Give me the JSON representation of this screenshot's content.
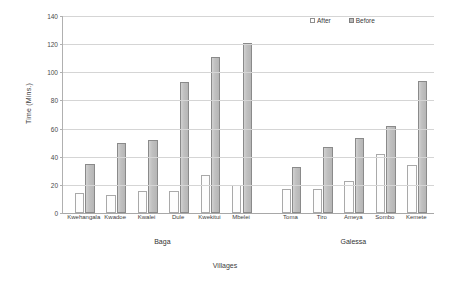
{
  "chart_data": {
    "type": "bar",
    "title": "",
    "xlabel": "Villages",
    "ylabel": "Time (Mins.)",
    "ylim": [
      0,
      140
    ],
    "ytick_step": 20,
    "yticks": [
      0,
      20,
      40,
      60,
      80,
      100,
      120,
      140
    ],
    "grid": true,
    "legend_position": "top-right",
    "categories": [
      "Kwehangala",
      "Kwadoe",
      "Kwalei",
      "Dule",
      "Kwekitui",
      "Mbelei",
      "Toma",
      "Tiro",
      "Ameya",
      "Sombo",
      "Kemete"
    ],
    "groups": [
      {
        "label": "Baga",
        "categories": [
          "Kwehangala",
          "Kwadoe",
          "Kwalei",
          "Dule",
          "Kwekitui",
          "Mbelei"
        ]
      },
      {
        "label": "Galessa",
        "categories": [
          "Toma",
          "Tiro",
          "Ameya",
          "Sombo",
          "Kemete"
        ]
      }
    ],
    "series": [
      {
        "name": "After",
        "color": "#ffffff",
        "border": "#a9a9a9",
        "values": [
          14,
          13,
          16,
          16,
          27,
          20,
          17,
          17,
          23,
          42,
          34
        ]
      },
      {
        "name": "Before",
        "color": "#bdbdbd",
        "border": "#8a8a8a",
        "values": [
          35,
          50,
          52,
          93,
          111,
          121,
          33,
          47,
          53,
          62,
          94
        ]
      }
    ]
  },
  "legend": {
    "items": [
      {
        "label": "After"
      },
      {
        "label": "Before"
      }
    ]
  }
}
